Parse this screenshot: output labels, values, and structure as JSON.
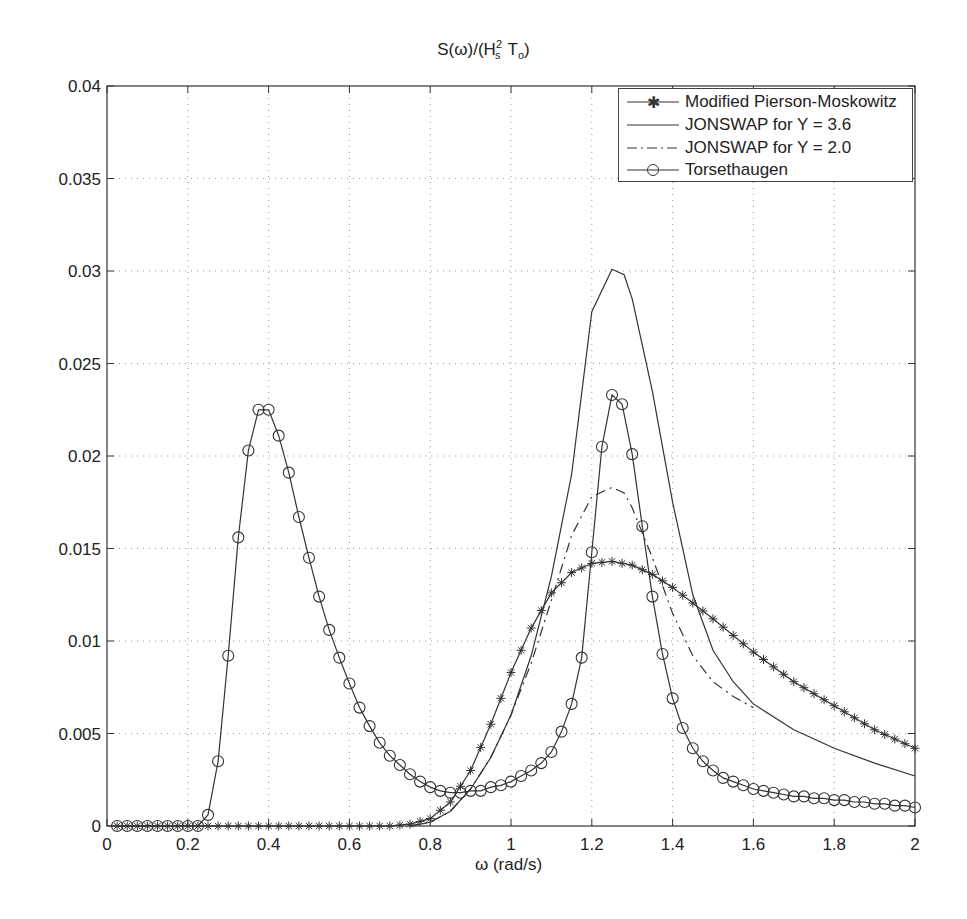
{
  "chart_data": {
    "type": "line",
    "title_parts": {
      "s": "S(ω)/(H",
      "sup": "2",
      "sub1": "s",
      "mid": "T",
      "sub2": "o",
      "end": ")"
    },
    "xlabel": "ω (rad/s)",
    "ylabel": "",
    "xlim": [
      0,
      2
    ],
    "ylim": [
      0,
      0.04
    ],
    "grid": true,
    "legend_position": "upper right",
    "x_ticks": [
      "0",
      "0.2",
      "0.4",
      "0.6",
      "0.8",
      "1",
      "1.2",
      "1.4",
      "1.6",
      "1.8",
      "2"
    ],
    "y_ticks": [
      "0",
      "0.005",
      "0.01",
      "0.015",
      "0.02",
      "0.025",
      "0.03",
      "0.035",
      "0.04"
    ],
    "series": [
      {
        "name": "Modified Pierson-Moskowitz",
        "style": "solid-star",
        "x": [
          0.02,
          0.1,
          0.2,
          0.3,
          0.4,
          0.5,
          0.6,
          0.7,
          0.75,
          0.8,
          0.85,
          0.9,
          0.95,
          1.0,
          1.05,
          1.1,
          1.15,
          1.2,
          1.25,
          1.3,
          1.35,
          1.4,
          1.5,
          1.6,
          1.7,
          1.8,
          1.9,
          2.0
        ],
        "values": [
          0,
          0,
          0,
          0,
          0,
          0,
          0,
          0,
          0.0001,
          0.0004,
          0.0013,
          0.003,
          0.0055,
          0.0083,
          0.0107,
          0.0126,
          0.0137,
          0.0142,
          0.0143,
          0.0141,
          0.0136,
          0.0129,
          0.0112,
          0.0094,
          0.0078,
          0.0065,
          0.0052,
          0.0042
        ]
      },
      {
        "name": "JONSWAP for Y = 3.6",
        "style": "solid",
        "x": [
          0.75,
          0.8,
          0.85,
          0.9,
          0.95,
          1.0,
          1.05,
          1.1,
          1.15,
          1.2,
          1.25,
          1.28,
          1.3,
          1.35,
          1.4,
          1.45,
          1.5,
          1.55,
          1.6,
          1.7,
          1.8,
          1.9,
          2.0
        ],
        "values": [
          0,
          0.0002,
          0.0008,
          0.002,
          0.0037,
          0.006,
          0.0092,
          0.0135,
          0.019,
          0.0278,
          0.0301,
          0.0298,
          0.0285,
          0.0235,
          0.0175,
          0.0125,
          0.0095,
          0.0078,
          0.0066,
          0.0052,
          0.0042,
          0.0034,
          0.0027
        ]
      },
      {
        "name": "JONSWAP for Y = 2.0",
        "style": "dash-dot",
        "x": [
          0.75,
          0.8,
          0.85,
          0.9,
          0.95,
          1.0,
          1.05,
          1.1,
          1.15,
          1.2,
          1.25,
          1.28,
          1.3,
          1.35,
          1.4,
          1.45,
          1.5,
          1.55,
          1.6
        ],
        "values": [
          0,
          0.0002,
          0.0008,
          0.002,
          0.0037,
          0.006,
          0.0088,
          0.0122,
          0.0157,
          0.0178,
          0.0183,
          0.018,
          0.0172,
          0.0145,
          0.0115,
          0.0092,
          0.0078,
          0.007,
          0.0064
        ]
      },
      {
        "name": "Torsethaugen",
        "style": "solid-circle",
        "x": [
          0.025,
          0.05,
          0.075,
          0.1,
          0.125,
          0.15,
          0.175,
          0.2,
          0.225,
          0.25,
          0.275,
          0.3,
          0.325,
          0.35,
          0.375,
          0.4,
          0.425,
          0.45,
          0.475,
          0.5,
          0.525,
          0.55,
          0.575,
          0.6,
          0.625,
          0.65,
          0.675,
          0.7,
          0.725,
          0.75,
          0.775,
          0.8,
          0.825,
          0.85,
          0.875,
          0.9,
          0.925,
          0.95,
          0.975,
          1.0,
          1.025,
          1.05,
          1.075,
          1.1,
          1.125,
          1.15,
          1.175,
          1.2,
          1.225,
          1.25,
          1.275,
          1.3,
          1.325,
          1.35,
          1.375,
          1.4,
          1.425,
          1.45,
          1.475,
          1.5,
          1.525,
          1.55,
          1.575,
          1.6,
          1.625,
          1.65,
          1.675,
          1.7,
          1.725,
          1.75,
          1.775,
          1.8,
          1.825,
          1.85,
          1.875,
          1.9,
          1.925,
          1.95,
          1.975,
          2.0
        ],
        "values": [
          0,
          0,
          0,
          0,
          0,
          0,
          0,
          0,
          0,
          0.0006,
          0.0035,
          0.0092,
          0.0156,
          0.0203,
          0.0225,
          0.0225,
          0.0211,
          0.0191,
          0.0167,
          0.0145,
          0.0124,
          0.0106,
          0.0091,
          0.0077,
          0.0064,
          0.0054,
          0.0045,
          0.0038,
          0.0033,
          0.0028,
          0.0024,
          0.0021,
          0.0019,
          0.0018,
          0.0018,
          0.0019,
          0.0019,
          0.0021,
          0.0022,
          0.0024,
          0.0027,
          0.003,
          0.0034,
          0.004,
          0.0051,
          0.0066,
          0.0091,
          0.0148,
          0.0205,
          0.0233,
          0.0228,
          0.0201,
          0.0162,
          0.0124,
          0.0093,
          0.0069,
          0.0053,
          0.0042,
          0.0035,
          0.003,
          0.0026,
          0.0024,
          0.0022,
          0.002,
          0.0019,
          0.0018,
          0.0017,
          0.0016,
          0.0016,
          0.0015,
          0.0015,
          0.0014,
          0.0014,
          0.0013,
          0.0013,
          0.0012,
          0.0012,
          0.0011,
          0.0011,
          0.001
        ]
      }
    ]
  },
  "legend": {
    "items": [
      {
        "label": "Modified Pierson-Moskowitz",
        "marker": "star-icon"
      },
      {
        "label": "JONSWAP for Y = 3.6",
        "marker": "solid-line-icon"
      },
      {
        "label": "JONSWAP for Y = 2.0",
        "marker": "dash-dot-line-icon"
      },
      {
        "label": "Torsethaugen",
        "marker": "circle-icon"
      }
    ]
  },
  "colors": {
    "line": "#333333",
    "grid": "#9a9a9a",
    "axis": "#333333"
  }
}
